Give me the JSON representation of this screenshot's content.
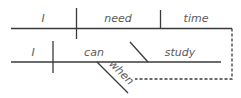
{
  "diagram": {
    "type": "sentence-diagram",
    "colors": {
      "line": "#3a3a3a",
      "text": "#5a5a5a",
      "background": "#ffffff"
    },
    "main_clause": {
      "subject": "I",
      "verb": "need",
      "direct_object": "time"
    },
    "subordinate_clause": {
      "subject": "I",
      "verb": "can",
      "complement": "study",
      "modifier": "when"
    }
  }
}
